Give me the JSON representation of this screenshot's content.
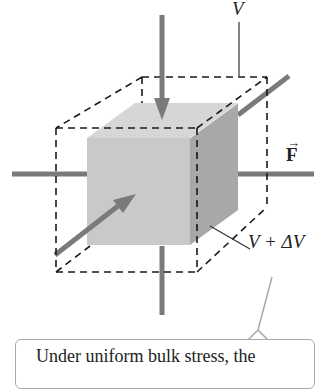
{
  "figure": {
    "labels": {
      "volume": "V",
      "force": "F",
      "force_arrow": "→",
      "new_volume": "V + ΔV"
    },
    "callout": {
      "text": "Under uniform bulk stress, the"
    },
    "colors": {
      "cube_front": "#c9c9c9",
      "cube_top": "#d6d6d6",
      "cube_side": "#a8a8a8",
      "arrow": "#7a7a7a",
      "dashed_box": "#1a1a1a",
      "callout_border": "#a9a9a9"
    }
  }
}
